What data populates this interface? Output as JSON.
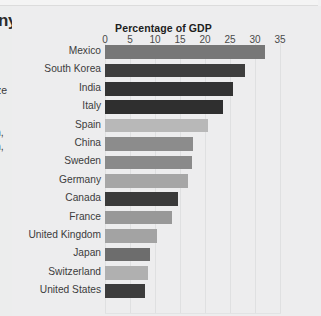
{
  "page_fragments": {
    "heading_tail": "ny",
    "body_tail_1": "ze",
    "body_tail_2": "n,",
    "body_tail_3": "n,",
    "fine_print": [
      "f",
      "t",
      "s",
      "al."
    ]
  },
  "chart_data": {
    "type": "bar",
    "orientation": "horizontal",
    "title": "Percentage of GDP",
    "xlabel": "",
    "ylabel": "",
    "xlim": [
      0,
      35
    ],
    "xticks": [
      0,
      5,
      10,
      15,
      20,
      25,
      30,
      35
    ],
    "grid": true,
    "legend": "none",
    "categories": [
      "Mexico",
      "South Korea",
      "India",
      "Italy",
      "Spain",
      "China",
      "Sweden",
      "Germany",
      "Canada",
      "France",
      "United Kingdom",
      "Japan",
      "Switzerland",
      "United States"
    ],
    "values": [
      32,
      28,
      25.5,
      23.5,
      20.5,
      17.6,
      17.4,
      16.6,
      14.6,
      13.4,
      10.4,
      9,
      8.6,
      8
    ],
    "bar_colors": [
      "#777777",
      "#3e3e3e",
      "#333333",
      "#2f2f2f",
      "#b8b8b8",
      "#8c8c8c",
      "#8a8a8a",
      "#a6a6a6",
      "#3a3a3a",
      "#989898",
      "#a3a3a3",
      "#6d6d6d",
      "#b0b0b0",
      "#3c3c3c"
    ]
  },
  "colors": {
    "panel_background": "#ededee",
    "page_background": "#ececed",
    "gridline": "#dfe0e1",
    "text": "#3c3c3c"
  }
}
